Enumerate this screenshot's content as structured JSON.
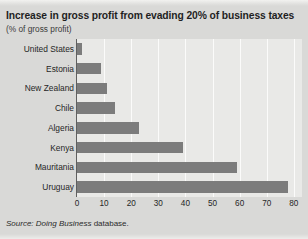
{
  "chart_data": {
    "type": "bar",
    "orientation": "horizontal",
    "title": "Increase in gross profit from evading 20% of business taxes",
    "subtitle": "(% of gross profit)",
    "xlabel": "",
    "ylabel": "",
    "categories": [
      "United States",
      "Estonia",
      "New Zealand",
      "Chile",
      "Algeria",
      "Kenya",
      "Mauritania",
      "Uruguay"
    ],
    "values": [
      2,
      9,
      11,
      14,
      23,
      39,
      59,
      78
    ],
    "xlim": [
      0,
      83
    ],
    "xticks": [
      "0",
      "10",
      "20",
      "30",
      "40",
      "50",
      "60",
      "70",
      "80"
    ],
    "xtick_values": [
      0,
      10,
      20,
      30,
      40,
      50,
      60,
      70,
      80
    ],
    "grid": "vertical-white",
    "legend": "none",
    "bar_color": "#7c7c7c",
    "plot_background": "#e9e9e7",
    "page_background": "#d9d9d7"
  },
  "source": {
    "prefix": "Source:",
    "publication": "Doing Business",
    "suffix": "database."
  }
}
